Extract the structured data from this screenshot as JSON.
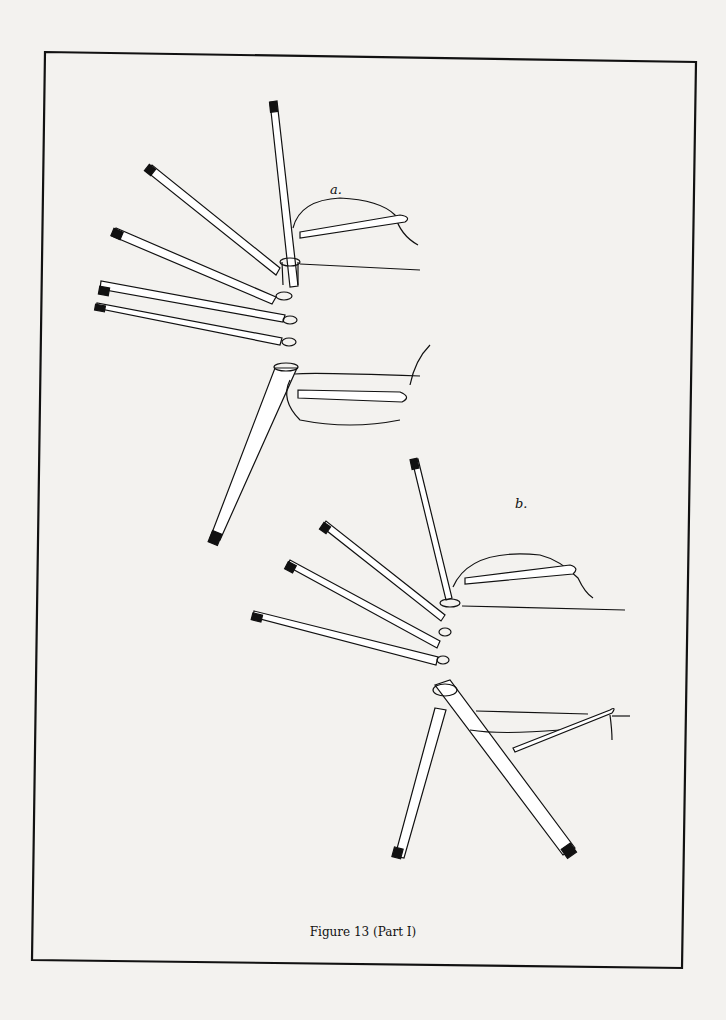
{
  "figure": {
    "caption": "Figure 13 (Part I)",
    "panels": [
      {
        "id": "a",
        "label": "a.",
        "sticks": [
          "1",
          "2",
          "3",
          "4",
          "5",
          "6"
        ]
      },
      {
        "id": "b",
        "label": "b.",
        "sticks": [
          "1",
          "2",
          "3",
          "4",
          "5",
          "6"
        ]
      }
    ]
  },
  "colors": {
    "ink": "#111111",
    "paper": "#f3f2ef"
  }
}
